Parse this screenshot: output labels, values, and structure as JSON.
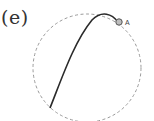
{
  "figure": {
    "panel_label": "(e)",
    "point_label": "A",
    "colors": {
      "circle_stroke": "#9a9a9a",
      "curve_stroke": "#2a2a2a",
      "point_fill": "#bdbdbd",
      "point_stroke": "#555555"
    }
  }
}
